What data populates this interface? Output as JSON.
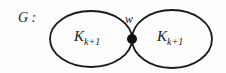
{
  "graph": {
    "name": "G :",
    "vertex": "w",
    "components": [
      {
        "main": "K",
        "sub": "k+1"
      },
      {
        "main": "K",
        "sub": "k+1"
      }
    ]
  }
}
